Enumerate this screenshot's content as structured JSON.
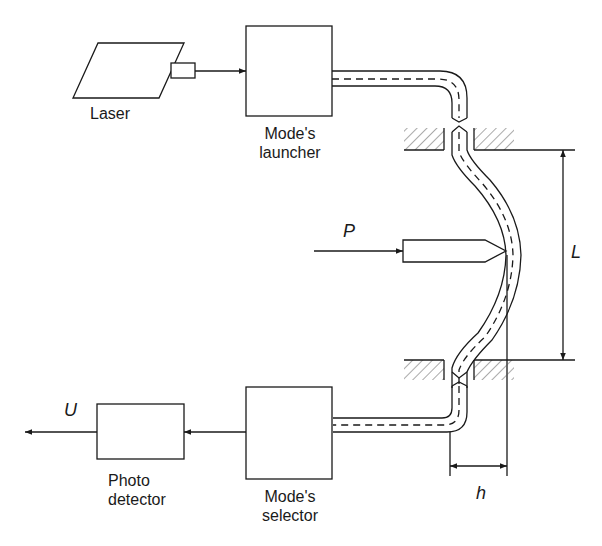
{
  "diagram": {
    "type": "block-diagram",
    "colors": {
      "stroke": "#1a1a1a",
      "hatch": "#555555",
      "background": "#ffffff"
    },
    "components": {
      "laser": {
        "label": "Laser"
      },
      "launcher": {
        "label_line1": "Mode's",
        "label_line2": "launcher"
      },
      "selector": {
        "label_line1": "Mode's",
        "label_line2": "selector"
      },
      "detector": {
        "label_line1": "Photo",
        "label_line2": "detector"
      },
      "plunger": {
        "force_label": "P"
      }
    },
    "dimensions": {
      "length": "L",
      "deflection": "h"
    },
    "output": {
      "label": "U"
    },
    "connections": [
      {
        "from": "Laser",
        "to": "Mode's launcher",
        "kind": "arrow"
      },
      {
        "from": "Mode's launcher",
        "to": "Mode's selector",
        "kind": "optical-fiber"
      },
      {
        "from": "Mode's selector",
        "to": "Photo detector",
        "kind": "arrow"
      },
      {
        "from": "Photo detector",
        "to": "U",
        "kind": "arrow"
      }
    ]
  }
}
